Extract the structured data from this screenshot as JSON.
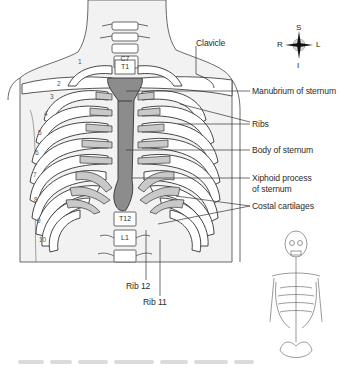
{
  "figure": {
    "labels": {
      "clavicle": "Clavicle",
      "manubrium": "Manubrium of sternum",
      "ribs": "Ribs",
      "body_sternum": "Body of sternum",
      "xiphoid_line1": "Xiphoid process",
      "xiphoid_line2": "of sternum",
      "costal_cartilages": "Costal cartilages",
      "rib12": "Rib 12",
      "rib11": "Rib 11"
    },
    "vertebrae": {
      "c7": "C7",
      "t1": "T1",
      "t12": "T12",
      "l1": "L1"
    },
    "rib_numbers": [
      "1",
      "2",
      "3",
      "4",
      "5",
      "6",
      "7",
      "8",
      "9",
      "10"
    ],
    "compass": {
      "superior": "S",
      "inferior": "I",
      "right": "R",
      "left": "L"
    },
    "inset": "Full skeleton thumbnail (thoracic region highlighted)",
    "colors": {
      "bone_fill": "#ffffff",
      "cartilage_fill": "#c9c9c9",
      "sternum_fill": "#8c8c8c",
      "body_fill": "#f2f2f2",
      "outline": "#333333"
    }
  }
}
